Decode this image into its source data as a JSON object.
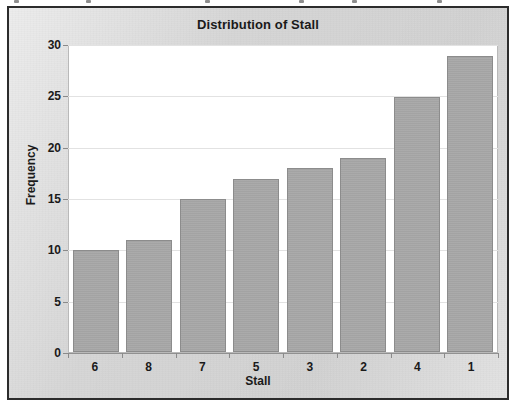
{
  "chart_data": {
    "type": "bar",
    "title": "Distribution of Stall",
    "xlabel": "Stall",
    "ylabel": "Frequency",
    "categories": [
      "6",
      "8",
      "7",
      "5",
      "3",
      "2",
      "4",
      "1"
    ],
    "values": [
      10,
      11,
      15,
      17,
      18,
      19,
      25,
      29
    ],
    "ylim": [
      0,
      30
    ],
    "yticks": [
      0,
      5,
      10,
      15,
      20,
      25,
      30
    ],
    "grid": true,
    "legend": "none",
    "colors": {
      "bar_fill": "#a6a6a6",
      "bar_border": "#8c8c8c",
      "panel_background": "#d6d6d6",
      "plot_background": "#ffffff",
      "frame_border": "#2c2c2c",
      "gridline": "#e2e2e2",
      "text": "#1a1a1a"
    }
  }
}
